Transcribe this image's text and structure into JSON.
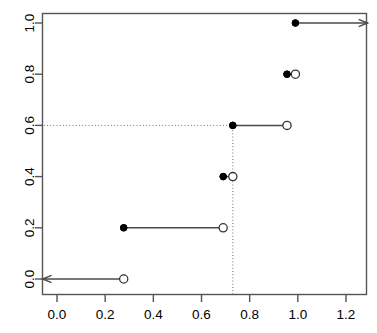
{
  "chart_data": {
    "type": "line",
    "subtype": "ecdf-step",
    "title": "",
    "subtitle": "",
    "xlabel": "",
    "ylabel": "",
    "xlim": [
      -0.04,
      1.32
    ],
    "ylim": [
      -0.04,
      1.04
    ],
    "grid": false,
    "legend": null,
    "x_ticks": [
      0.0,
      0.2,
      0.4,
      0.6,
      0.8,
      1.0,
      1.2
    ],
    "x_tick_labels": [
      "0.0",
      "0.2",
      "0.4",
      "0.6",
      "0.8",
      "1.0",
      "1.2"
    ],
    "y_ticks": [
      0.0,
      0.2,
      0.4,
      0.6,
      0.8,
      1.0
    ],
    "y_tick_labels": [
      "0.0",
      "0.2",
      "0.4",
      "0.6",
      "0.8",
      "1.0"
    ],
    "jump_points": [
      0.277,
      0.69,
      0.73,
      0.955,
      0.99
    ],
    "steps": [
      {
        "y": 0.0,
        "x_start": -0.06,
        "x_end": 0.277,
        "left_marker": "arrow-left",
        "right_marker": "open-circle"
      },
      {
        "y": 0.2,
        "x_start": 0.277,
        "x_end": 0.69,
        "left_marker": "filled-circle",
        "right_marker": "open-circle"
      },
      {
        "y": 0.4,
        "x_start": 0.69,
        "x_end": 0.73,
        "left_marker": "filled-circle",
        "right_marker": "open-circle"
      },
      {
        "y": 0.6,
        "x_start": 0.73,
        "x_end": 0.955,
        "left_marker": "filled-circle",
        "right_marker": "open-circle"
      },
      {
        "y": 0.8,
        "x_start": 0.955,
        "x_end": 0.99,
        "left_marker": "filled-circle",
        "right_marker": "open-circle"
      },
      {
        "y": 1.0,
        "x_start": 0.99,
        "x_end": 1.29,
        "left_marker": "filled-circle",
        "right_marker": "arrow-right"
      }
    ],
    "reference_lines": [
      {
        "orientation": "horizontal",
        "value": 0.6,
        "from": -0.055,
        "to": 0.73,
        "style": "dotted"
      },
      {
        "orientation": "vertical",
        "value": 0.73,
        "from": -0.06,
        "to": 0.6,
        "style": "dotted"
      }
    ]
  },
  "colors": {
    "axis": "#545454",
    "line": "#4a4a4a",
    "marker_fill": "#000000",
    "marker_stroke": "#333333",
    "dotted": "#6e6e6e",
    "background": "#ffffff",
    "text": "#000000"
  }
}
